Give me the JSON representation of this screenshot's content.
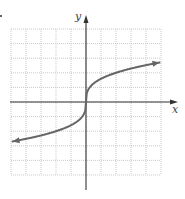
{
  "chart_data": {
    "type": "line",
    "title": "",
    "xlabel": "x",
    "ylabel": "y",
    "xlim": [
      -5,
      5
    ],
    "ylim": [
      -5,
      5
    ],
    "grid": true,
    "grid_style": "dotted",
    "tick_labels": false,
    "legend": null,
    "series": [
      {
        "name": "curve",
        "description": "increasing cube-root-shaped curve through origin, arrows at both ends",
        "x": [
          -4.9,
          -4,
          -3,
          -2,
          -1,
          -0.5,
          0,
          0.5,
          1,
          2,
          3,
          4,
          4.9
        ],
        "y": [
          -2.7,
          -2.54,
          -2.31,
          -2.02,
          -1.6,
          -1.27,
          0,
          1.27,
          1.6,
          2.02,
          2.31,
          2.54,
          2.7
        ],
        "arrows": [
          "start",
          "end"
        ]
      }
    ]
  },
  "labels": {
    "x_axis": "x",
    "y_axis": "y"
  },
  "colors": {
    "axis": "#333333",
    "grid": "#bbbbbb",
    "curve": "#666666"
  }
}
